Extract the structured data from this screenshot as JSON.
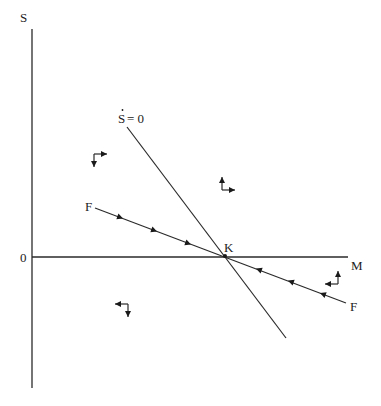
{
  "diagram": {
    "type": "phase-diagram",
    "axes": {
      "vertical_label": "S",
      "horizontal_label": "M",
      "origin_label": "0"
    },
    "curves": [
      {
        "id": "s-dot-zero",
        "label": "Ṡ = 0",
        "label_parts": {
          "var": "S",
          "rest": " = 0",
          "dot": "·"
        }
      },
      {
        "id": "saddle-path",
        "label": "F",
        "label_left": "F",
        "label_right": "F",
        "direction": "converging toward K"
      }
    ],
    "equilibrium": {
      "label": "K"
    },
    "regions": [
      {
        "name": "upper-left",
        "vertical": "down",
        "horizontal": "right"
      },
      {
        "name": "upper-right",
        "vertical": "up",
        "horizontal": "right"
      },
      {
        "name": "lower-left",
        "vertical": "down",
        "horizontal": "left"
      },
      {
        "name": "lower-right",
        "vertical": "up",
        "horizontal": "left"
      }
    ]
  }
}
